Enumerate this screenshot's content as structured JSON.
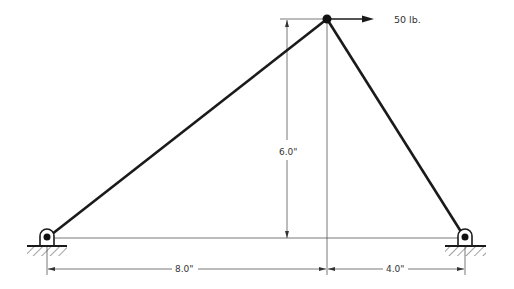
{
  "diagram": {
    "type": "truss",
    "load": {
      "label": "50 lb.",
      "direction": "right"
    },
    "dimensions": {
      "height": "6.0\"",
      "left_span": "8.0\"",
      "right_span": "4.0\""
    },
    "supports": [
      {
        "name": "left",
        "type": "pin"
      },
      {
        "name": "right",
        "type": "pin"
      }
    ],
    "colors": {
      "member": "#1a1a1a",
      "dimension": "#555555"
    }
  }
}
